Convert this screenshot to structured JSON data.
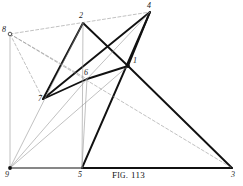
{
  "figure": {
    "caption_prefix": "F",
    "caption_smallcaps": "IG",
    "caption_rest": ". 113",
    "caption_full": "Fig. 113",
    "width": 243,
    "height": 186,
    "ink_color": "#111111",
    "light_color": "#8d8d8d",
    "background": "#ffffff"
  },
  "points": [
    {
      "id": "p1",
      "label": "1",
      "x": 128,
      "y": 66,
      "lx": 133,
      "ly": 57,
      "marker": "dot"
    },
    {
      "id": "p2",
      "label": "2",
      "x": 83,
      "y": 23,
      "lx": 79,
      "ly": 12,
      "marker": "none"
    },
    {
      "id": "p3",
      "label": "3",
      "x": 232,
      "y": 168,
      "lx": 231,
      "ly": 171,
      "marker": "none"
    },
    {
      "id": "p4",
      "label": "4",
      "x": 150,
      "y": 12,
      "lx": 147,
      "ly": 2,
      "marker": "none"
    },
    {
      "id": "p5",
      "label": "5",
      "x": 82,
      "y": 168,
      "lx": 78,
      "ly": 171,
      "marker": "none"
    },
    {
      "id": "p6",
      "label": "6",
      "x": 87,
      "y": 79,
      "lx": 84,
      "ly": 69,
      "marker": "none"
    },
    {
      "id": "p7",
      "label": "7",
      "x": 43,
      "y": 99,
      "lx": 38,
      "ly": 95,
      "marker": "none"
    },
    {
      "id": "p8",
      "label": "8",
      "x": 10,
      "y": 34,
      "lx": 2,
      "ly": 26,
      "marker": "circle"
    },
    {
      "id": "p9",
      "label": "9",
      "x": 10,
      "y": 168,
      "lx": 5,
      "ly": 171,
      "marker": "dot"
    }
  ],
  "segments": [
    {
      "name": "seg-2-7",
      "from": "p2",
      "to": "p7",
      "weight": "heavy",
      "style": "solid"
    },
    {
      "name": "seg-2-1",
      "from": "p2",
      "to": "p1",
      "weight": "heavy",
      "style": "solid"
    },
    {
      "name": "seg-4-7",
      "from": "p4",
      "to": "p7",
      "weight": "heavy",
      "style": "solid"
    },
    {
      "name": "seg-4-5",
      "from": "p4",
      "to": "p5",
      "weight": "heavy",
      "style": "solid"
    },
    {
      "name": "seg-1-3",
      "from": "p1",
      "to": "p3",
      "weight": "heavy",
      "style": "solid"
    },
    {
      "name": "seg-1-4",
      "from": "p1",
      "to": "p4",
      "weight": "heavy",
      "style": "solid"
    },
    {
      "name": "seg-7-6",
      "from": "p7",
      "to": "p6",
      "weight": "heavy",
      "style": "solid"
    },
    {
      "name": "seg-6-1",
      "from": "p6",
      "to": "p1",
      "weight": "heavy",
      "style": "solid"
    },
    {
      "name": "seg-5-3",
      "from": "p5",
      "to": "p3",
      "weight": "heavy",
      "style": "solid"
    },
    {
      "name": "seg-9-5",
      "from": "p9",
      "to": "p5",
      "weight": "medium",
      "style": "solid"
    },
    {
      "name": "seg-9-2",
      "from": "p9",
      "to": "p2",
      "weight": "light",
      "style": "solid"
    },
    {
      "name": "seg-9-6",
      "from": "p9",
      "to": "p6",
      "weight": "light",
      "style": "solid"
    },
    {
      "name": "seg-9-1",
      "from": "p9",
      "to": "p1",
      "weight": "light",
      "style": "solid"
    },
    {
      "name": "seg-9-8",
      "from": "p9",
      "to": "p8",
      "weight": "light",
      "style": "solid"
    },
    {
      "name": "seg-5-6",
      "from": "p5",
      "to": "p6",
      "weight": "light",
      "style": "solid"
    },
    {
      "name": "seg-5-2",
      "from": "p5",
      "to": "p2",
      "weight": "light",
      "style": "solid"
    },
    {
      "name": "seg-8-4",
      "from": "p8",
      "to": "p4",
      "weight": "light",
      "style": "dashed"
    },
    {
      "name": "seg-8-6",
      "from": "p8",
      "to": "p6",
      "weight": "light",
      "style": "dashed"
    },
    {
      "name": "seg-8-3",
      "from": "p8",
      "to": "p3",
      "weight": "light",
      "style": "dashed"
    },
    {
      "name": "seg-8-7",
      "from": "p8",
      "to": "p7",
      "weight": "light",
      "style": "dashed"
    },
    {
      "name": "seg-6-4",
      "from": "p6",
      "to": "p4",
      "weight": "light",
      "style": "solid"
    }
  ]
}
